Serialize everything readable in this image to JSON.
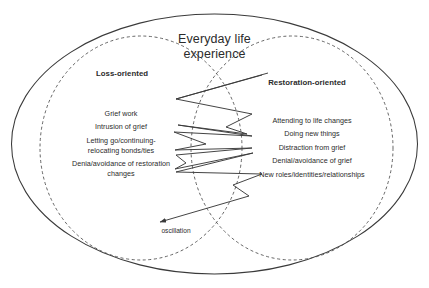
{
  "figure": {
    "title_line1": "Everyday life",
    "title_line2": "experience",
    "oscillation_label": "oscillation",
    "colors": {
      "text": "#2b2b2b",
      "stroke": "#3a3a3a",
      "background": "#ffffff"
    }
  },
  "loss_oriented": {
    "heading": "Loss-oriented",
    "items": [
      "Grief work",
      "Intrusion of grief",
      "Letting go/continuing-",
      "relocating bonds/ties",
      "Denia/avoidance of restoration",
      "changes"
    ],
    "item_1": "Grief work",
    "item_2": "Intrusion of grief",
    "item_3_line1": "Letting go/continuing-",
    "item_3_line2": "relocating bonds/ties",
    "item_4_line1": "Denia/avoidance of restoration",
    "item_4_line2": "changes"
  },
  "restoration_oriented": {
    "heading": "Restoration-oriented",
    "items": [
      "Attending to life changes",
      "Doing new things",
      "Distraction from grief",
      "Denial/avoidance of grief",
      "New roles/identities/relationships"
    ],
    "item_1": "Attending to life changes",
    "item_2": "Doing new things",
    "item_3": "Distraction from grief",
    "item_4": "Denial/avoidance of grief",
    "item_5": "New roles/identities/relationships"
  }
}
